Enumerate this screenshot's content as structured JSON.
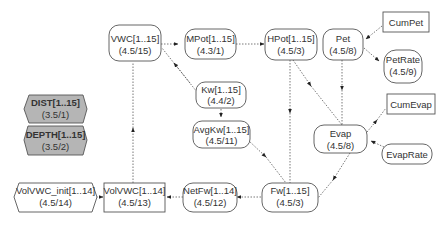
{
  "diagram": {
    "title": "",
    "nodes": {
      "vwc": {
        "label": "VWC[1..15]",
        "sub": "(4.5/15)",
        "shape": "rounded"
      },
      "mpot": {
        "label": "MPot[1..15]",
        "sub": "(4.3/1)",
        "shape": "rounded"
      },
      "hpot": {
        "label": "HPot[1..15]",
        "sub": "(4.5/3)",
        "shape": "rounded"
      },
      "pet": {
        "label": "Pet",
        "sub": "(4.5/8)",
        "shape": "rounded"
      },
      "cumpet": {
        "label": "CumPet",
        "sub": "",
        "shape": "rect"
      },
      "petrate": {
        "label": "PetRate",
        "sub": "(4.5/9)",
        "shape": "rounded"
      },
      "kw": {
        "label": "Kw[1..15]",
        "sub": "(4.4/2)",
        "shape": "rounded"
      },
      "avgkw": {
        "label": "AvgKw[1..15]",
        "sub": "(4.5/11)",
        "shape": "rounded"
      },
      "dist": {
        "label": "DIST[1..15]",
        "sub": "(3.5/1)",
        "shape": "hexagon-grey"
      },
      "depth": {
        "label": "DEPTH[1..15]",
        "sub": "(3.5/2)",
        "shape": "hexagon-grey"
      },
      "cumevap": {
        "label": "CumEvap",
        "sub": "",
        "shape": "rect"
      },
      "evap": {
        "label": "Evap",
        "sub": "(4.5/8)",
        "shape": "rounded"
      },
      "evaprate": {
        "label": "EvapRate",
        "sub": "",
        "shape": "rounded"
      },
      "volvwc_init": {
        "label": "VolVWC_init[1..14]",
        "sub": "(4.5/14)",
        "shape": "hexagon"
      },
      "volvwc": {
        "label": "VolVWC[1..14]",
        "sub": "(4.5/13)",
        "shape": "rect"
      },
      "netfw": {
        "label": "NetFw[1..14]",
        "sub": "(4.5/12)",
        "shape": "rounded"
      },
      "fw": {
        "label": "Fw[1..15]",
        "sub": "(4.5/3)",
        "shape": "rounded"
      }
    },
    "edges": [
      {
        "from": "VWC[1..15]",
        "to": "MPot[1..15]"
      },
      {
        "from": "MPot[1..15]",
        "to": "HPot[1..15]"
      },
      {
        "from": "Kw[1..15]",
        "to": "VWC[1..15]"
      },
      {
        "from": "HPot[1..15]",
        "to": "Fw[1..15]"
      },
      {
        "from": "HPot[1..15]",
        "to": "Evap"
      },
      {
        "from": "Pet",
        "to": "Evap"
      },
      {
        "from": "CumPet",
        "to": "Pet"
      },
      {
        "from": "Pet",
        "to": "PetRate"
      },
      {
        "from": "Kw[1..15]",
        "to": "AvgKw[1..15]"
      },
      {
        "from": "AvgKw[1..15]",
        "to": "Fw[1..15]"
      },
      {
        "from": "Evap",
        "to": "CumEvap"
      },
      {
        "from": "EvapRate",
        "to": "Evap"
      },
      {
        "from": "Evap",
        "to": "Fw[1..15]"
      },
      {
        "from": "Fw[1..15]",
        "to": "NetFw[1..14]"
      },
      {
        "from": "NetFw[1..14]",
        "to": "VolVWC[1..14]"
      },
      {
        "from": "VolVWC_init[1..14]",
        "to": "VolVWC[1..14]"
      },
      {
        "from": "VolVWC[1..14]",
        "to": "VWC[1..15]"
      },
      {
        "from": "Fw[1..15]",
        "to": "HPot[1..15]"
      }
    ],
    "colors": {
      "node_fill": "#ffffff",
      "grey_node_fill": "#b5b5b5",
      "stroke": "#555555",
      "text": "#333333"
    }
  }
}
